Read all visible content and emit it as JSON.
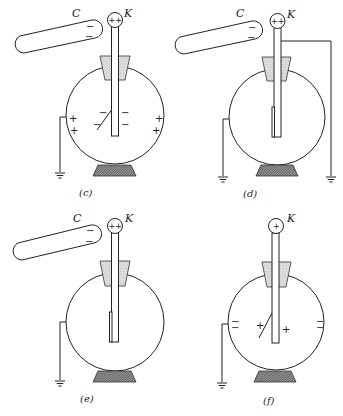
{
  "figure": {
    "labels": {
      "rod": "C",
      "knob": "K"
    },
    "panels": [
      {
        "caption": "(c)",
        "rod_charges": [
          "−",
          "−"
        ],
        "knob_charges": "++",
        "leaf_charges": [
          "−",
          "−"
        ],
        "rod_inner_charges": [
          "−",
          "−"
        ],
        "globe_left_charges": [
          "+",
          "+"
        ],
        "globe_right_charges": [
          "+",
          "+"
        ],
        "grounded_globe": true,
        "grounded_rod": false,
        "leaf_diverged": true
      },
      {
        "caption": "(d)",
        "rod_charges": [
          "−",
          "−"
        ],
        "knob_charges": "++",
        "grounded_globe": true,
        "grounded_rod": true,
        "leaf_diverged": false
      },
      {
        "caption": "(e)",
        "rod_charges": [
          "−",
          "−"
        ],
        "knob_charges": "++",
        "grounded_globe": true,
        "grounded_rod": false,
        "leaf_diverged": false
      },
      {
        "caption": "(f)",
        "knob_charges": "+",
        "leaf_charges": [
          "+"
        ],
        "rod_inner_charges": [
          "+"
        ],
        "globe_left_charges": [
          "−",
          "−"
        ],
        "globe_right_charges": [
          "−",
          "−"
        ],
        "grounded_globe": true,
        "grounded_rod": false,
        "leaf_diverged": true
      }
    ],
    "colors": {
      "line": "#222222",
      "stopper_fill": "#d8d8d8",
      "base_fill": "#8a8a8a",
      "background": "#ffffff"
    }
  }
}
